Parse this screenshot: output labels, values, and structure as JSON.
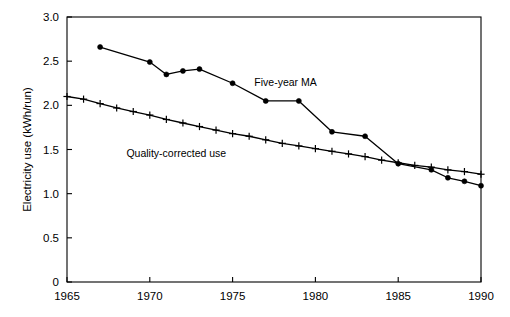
{
  "chart_data": {
    "type": "line",
    "title": "",
    "xlabel": "",
    "ylabel": "Electricity use (kWh/run)",
    "xlim": [
      1965,
      1990
    ],
    "ylim": [
      0,
      3.0
    ],
    "xticks": [
      1965,
      1970,
      1975,
      1980,
      1985,
      1990
    ],
    "xtick_labels": [
      "1965",
      "1970",
      "1975",
      "1980",
      "1985",
      "1990"
    ],
    "yticks": [
      0,
      0.5,
      1.0,
      1.5,
      2.0,
      2.5,
      3.0
    ],
    "ytick_labels": [
      "0",
      "0.5",
      "1.0",
      "1.5",
      "2.0",
      "2.5",
      "3.0"
    ],
    "grid": false,
    "legend_position": "inline-annotations",
    "series": [
      {
        "name": "Five-year MA",
        "marker": "filled-circle",
        "label_x": 1978.2,
        "label_y": 2.22,
        "x": [
          1967,
          1970,
          1971,
          1972,
          1973,
          1975,
          1977,
          1979,
          1981,
          1983,
          1985,
          1987,
          1988,
          1989,
          1990
        ],
        "values": [
          2.66,
          2.49,
          2.35,
          2.39,
          2.41,
          2.25,
          2.05,
          2.05,
          1.7,
          1.65,
          1.34,
          1.27,
          1.18,
          1.14,
          1.09
        ]
      },
      {
        "name": "Quality-corrected use",
        "marker": "plus",
        "label_x": 1971.6,
        "label_y": 1.42,
        "x": [
          1965,
          1966,
          1967,
          1968,
          1969,
          1970,
          1971,
          1972,
          1973,
          1974,
          1975,
          1976,
          1977,
          1978,
          1979,
          1980,
          1981,
          1982,
          1983,
          1984,
          1985,
          1986,
          1987,
          1988,
          1989,
          1990
        ],
        "values": [
          2.1,
          2.07,
          2.02,
          1.97,
          1.93,
          1.89,
          1.84,
          1.8,
          1.76,
          1.72,
          1.68,
          1.65,
          1.61,
          1.57,
          1.54,
          1.51,
          1.48,
          1.45,
          1.42,
          1.38,
          1.35,
          1.32,
          1.3,
          1.27,
          1.25,
          1.22
        ]
      }
    ],
    "colors": {
      "line": "#000000",
      "axis": "#000000",
      "background": "#ffffff"
    }
  }
}
